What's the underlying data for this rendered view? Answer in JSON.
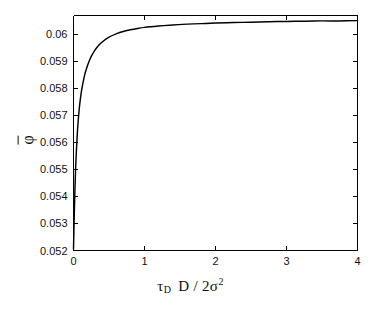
{
  "figure": {
    "background_color": "#ffffff",
    "axis_color": "#000000",
    "curve_color": "#000000"
  },
  "axes": {
    "ylabel_symbol": "φ",
    "xlabel_tau": "τ",
    "xlabel_tau_sub": "D",
    "xlabel_mid": "D / 2",
    "xlabel_sigma": "σ",
    "xlabel_sigma_sup": "2"
  },
  "chart_data": {
    "type": "line",
    "title": "",
    "xlabel": "τ_D D / 2σ^2",
    "ylabel": "φ̄",
    "xlim": [
      0,
      4
    ],
    "ylim": [
      0.052,
      0.0607
    ],
    "grid": false,
    "legend": null,
    "xticks": [
      0,
      1,
      2,
      3,
      4
    ],
    "xticklabels": [
      "0",
      "1",
      "2",
      "3",
      "4"
    ],
    "yticks": [
      0.052,
      0.053,
      0.054,
      0.055,
      0.056,
      0.057,
      0.058,
      0.059,
      0.06
    ],
    "yticklabels": [
      "0.052",
      "0.053",
      "0.054",
      "0.055",
      "0.056",
      "0.057",
      "0.058",
      "0.059",
      "0.06"
    ],
    "series": [
      {
        "name": "phi-bar",
        "x": [
          0.0,
          0.01,
          0.02,
          0.03,
          0.04,
          0.05,
          0.06,
          0.08,
          0.1,
          0.12,
          0.15,
          0.18,
          0.22,
          0.26,
          0.3,
          0.35,
          0.4,
          0.5,
          0.6,
          0.7,
          0.8,
          0.9,
          1.0,
          1.2,
          1.4,
          1.6,
          1.8,
          2.0,
          2.25,
          2.5,
          2.75,
          3.0,
          3.25,
          3.5,
          3.75,
          4.0
        ],
        "y": [
          0.05205,
          0.05325,
          0.05425,
          0.05505,
          0.05565,
          0.05615,
          0.05658,
          0.05722,
          0.05768,
          0.05802,
          0.05842,
          0.05871,
          0.05901,
          0.05923,
          0.05941,
          0.05958,
          0.05971,
          0.0599,
          0.06002,
          0.06011,
          0.06017,
          0.06022,
          0.06026,
          0.06031,
          0.06035,
          0.06038,
          0.0604,
          0.06042,
          0.06044,
          0.06045,
          0.06047,
          0.06048,
          0.06049,
          0.0605,
          0.0605,
          0.06051
        ]
      }
    ]
  }
}
